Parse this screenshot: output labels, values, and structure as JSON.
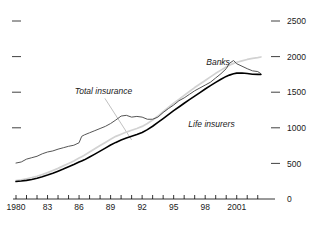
{
  "chart_data": {
    "type": "line",
    "title": "",
    "xlabel": "",
    "ylabel": "",
    "ylim": [
      0,
      2750
    ],
    "xlim": [
      1980,
      2003.5
    ],
    "yticks": [
      0,
      500,
      1000,
      1500,
      2000,
      2500
    ],
    "ytick_labels": [
      "0",
      "500",
      "1000",
      "1500",
      "2000",
      "2500"
    ],
    "ytick_side": "right",
    "left_ytick_marks": [
      1000,
      1500,
      2000,
      2500
    ],
    "xticks": [
      1980,
      1981,
      1982,
      1983,
      1984,
      1985,
      1986,
      1987,
      1988,
      1989,
      1990,
      1991,
      1992,
      1993,
      1994,
      1995,
      1996,
      1997,
      1998,
      1999,
      2000,
      2001,
      2002,
      2003
    ],
    "xtick_labels_shown": [
      "1980",
      "83",
      "86",
      "89",
      "92",
      "95",
      "98",
      "2001"
    ],
    "xtick_labels_at": [
      1980,
      1983,
      1986,
      1989,
      1992,
      1995,
      1998,
      2001
    ],
    "grid": false,
    "legend_position": "inline-annotations",
    "annotations": [
      {
        "text": "Banks",
        "x": 1998.1,
        "y": 1880,
        "series": "Banks",
        "leader": false
      },
      {
        "text": "Total insurance",
        "x": 1985.6,
        "y": 1470,
        "series": "Total insurance",
        "leader": true,
        "leader_to_x": 1991.0,
        "leader_to_y": 830
      },
      {
        "text": "Life insurers",
        "x": 1996.4,
        "y": 1010,
        "series": "Life insurers",
        "leader": false
      }
    ],
    "colors": {
      "banks": "#555555",
      "total_insurance": "#d2d2d2",
      "life_insurers": "#000000",
      "axis": "#000000",
      "text": "#1a1a1a",
      "leader": "#b0b0b0",
      "background": "#ffffff"
    },
    "x": [
      1980,
      1980.5,
      1981,
      1981.5,
      1982,
      1982.5,
      1983,
      1983.5,
      1984,
      1984.5,
      1985,
      1985.5,
      1986,
      1986.25,
      1986.5,
      1987,
      1987.5,
      1988,
      1988.5,
      1989,
      1989.5,
      1990,
      1990.5,
      1991,
      1991.5,
      1992,
      1992.5,
      1993,
      1993.5,
      1994,
      1994.5,
      1995,
      1995.5,
      1996,
      1996.5,
      1997,
      1997.5,
      1998,
      1998.5,
      1999,
      1999.5,
      2000,
      2000.3,
      2000.7,
      2001,
      2001.5,
      2002,
      2002.5,
      2003,
      2003.3
    ],
    "series": [
      {
        "name": "Banks",
        "color": "#555555",
        "style": "jagged",
        "values": [
          505,
          520,
          560,
          580,
          600,
          635,
          660,
          675,
          700,
          720,
          740,
          755,
          790,
          880,
          900,
          930,
          960,
          990,
          1020,
          1060,
          1110,
          1165,
          1175,
          1150,
          1160,
          1150,
          1120,
          1120,
          1150,
          1215,
          1270,
          1320,
          1380,
          1420,
          1470,
          1520,
          1560,
          1600,
          1640,
          1700,
          1760,
          1830,
          1905,
          1945,
          1900,
          1865,
          1830,
          1800,
          1790,
          1760
        ]
      },
      {
        "name": "Total insurance",
        "color": "#d2d2d2",
        "style": "smooth",
        "values": [
          260,
          270,
          285,
          300,
          320,
          345,
          370,
          400,
          430,
          465,
          500,
          535,
          575,
          595,
          615,
          660,
          705,
          750,
          795,
          840,
          880,
          910,
          940,
          965,
          990,
          1020,
          1060,
          1110,
          1165,
          1225,
          1285,
          1345,
          1400,
          1455,
          1510,
          1565,
          1615,
          1665,
          1715,
          1765,
          1810,
          1855,
          1880,
          1905,
          1920,
          1940,
          1960,
          1975,
          1985,
          1995
        ]
      },
      {
        "name": "Life insurers",
        "color": "#000000",
        "style": "smooth",
        "values": [
          245,
          252,
          262,
          275,
          292,
          312,
          336,
          362,
          390,
          420,
          452,
          485,
          520,
          535,
          550,
          590,
          630,
          672,
          715,
          758,
          795,
          828,
          856,
          880,
          905,
          935,
          975,
          1022,
          1075,
          1130,
          1185,
          1240,
          1292,
          1345,
          1395,
          1445,
          1495,
          1545,
          1592,
          1638,
          1682,
          1722,
          1740,
          1758,
          1768,
          1770,
          1762,
          1752,
          1750,
          1748
        ]
      }
    ]
  }
}
